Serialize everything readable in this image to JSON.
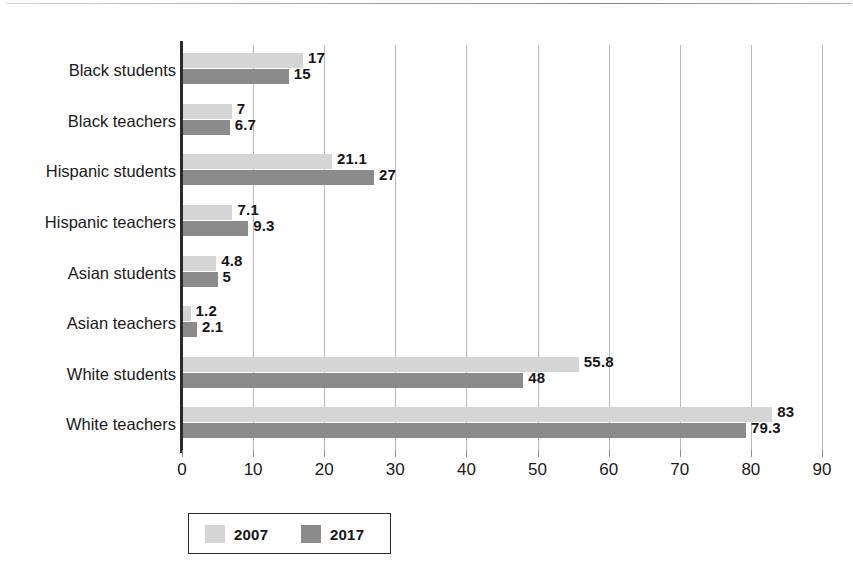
{
  "chart_data": {
    "type": "bar",
    "orientation": "horizontal",
    "title": "",
    "subtitle": "",
    "xlabel": "",
    "ylabel": "",
    "xlim": [
      0,
      90
    ],
    "xticks": [
      0,
      10,
      20,
      30,
      40,
      50,
      60,
      70,
      80,
      90
    ],
    "xtick_labels": [
      "0",
      "10",
      "20",
      "30",
      "40",
      "50",
      "60",
      "70",
      "80",
      "90"
    ],
    "grid": true,
    "grid_axis": "x",
    "legend_position": "bottom-left",
    "categories": [
      "Black students",
      "Black teachers",
      "Hispanic students",
      "Hispanic teachers",
      "Asian students",
      "Asian teachers",
      "White students",
      "White teachers"
    ],
    "series": [
      {
        "name": "2007",
        "color": "#d5d5d5",
        "values": [
          17,
          7,
          21.1,
          7.1,
          4.8,
          1.2,
          55.8,
          83
        ],
        "value_labels": [
          "17",
          "7",
          "21.1",
          "7.1",
          "4.8",
          "1.2",
          "55.8",
          "83"
        ]
      },
      {
        "name": "2017",
        "color": "#8b8b8b",
        "values": [
          15,
          6.7,
          27,
          9.3,
          5,
          2.1,
          48,
          79.3
        ],
        "value_labels": [
          "15",
          "6.7",
          "27",
          "9.3",
          "5",
          "2.1",
          "48",
          "79.3"
        ]
      }
    ]
  },
  "legend": {
    "items": [
      {
        "label": "2007",
        "color": "#d5d5d5"
      },
      {
        "label": "2017",
        "color": "#8b8b8b"
      }
    ]
  },
  "colors": {
    "series_2007": "#d5d5d5",
    "series_2017": "#8b8b8b",
    "axis": "#2b2b2b",
    "gridline": "#b9b9b9",
    "text": "#1a1a1a"
  }
}
